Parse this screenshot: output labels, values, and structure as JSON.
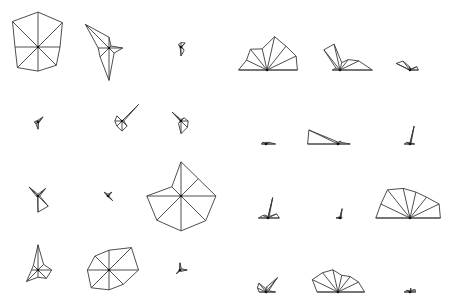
{
  "chart_data": {
    "type": "star",
    "title": "",
    "colors": {
      "stroke": "#3a3a3a",
      "hub": "#111111",
      "background": "#ffffff"
    },
    "panels": [
      {
        "name": "star-panel",
        "kind": "full",
        "variables": 8,
        "max_radius": 36,
        "glyphs": [
          {
            "cx": 38,
            "cy": 47,
            "r": [
              0.97,
              0.96,
              0.61,
              0.72,
              0.67,
              0.81,
              0.64,
              1.0
            ]
          },
          {
            "cx": 109,
            "cy": 48,
            "r": [
              0.3,
              0.08,
              0.38,
              0.2,
              0.9,
              0.35,
              0.3,
              0.93
            ]
          },
          {
            "cx": 181,
            "cy": 47,
            "r": [
              0.12,
              0.16,
              0.02,
              0.12,
              0.25,
              0.03,
              0.03,
              0.1
            ]
          },
          {
            "cx": 38,
            "cy": 122,
            "r": [
              0.05,
              0.2,
              0.04,
              0.02,
              0.2,
              0.08,
              0.1,
              0.05
            ]
          },
          {
            "cx": 122,
            "cy": 121,
            "r": [
              0.0,
              0.65,
              0.05,
              0.2,
              0.28,
              0.2,
              0.2,
              0.2
            ]
          },
          {
            "cx": 181,
            "cy": 121,
            "r": [
              0.04,
              0.12,
              0.2,
              0.25,
              0.35,
              0.1,
              0.02,
              0.35
            ]
          },
          {
            "cx": 38,
            "cy": 196,
            "r": [
              0.05,
              0.3,
              0.05,
              0.4,
              0.45,
              0.02,
              0.05,
              0.35
            ]
          },
          {
            "cx": 108,
            "cy": 196,
            "r": [
              0.05,
              0.15,
              0.02,
              0.18,
              0.02,
              0.02,
              0.02,
              0.15
            ]
          },
          {
            "cx": 181,
            "cy": 196,
            "r": [
              0.95,
              0.68,
              0.97,
              0.97,
              0.97,
              0.95,
              0.95,
              0.36
            ]
          },
          {
            "cx": 38,
            "cy": 270,
            "r": [
              0.7,
              0.22,
              0.38,
              0.33,
              0.2,
              0.45,
              0.18,
              0.18
            ]
          },
          {
            "cx": 109,
            "cy": 270,
            "r": [
              0.55,
              0.88,
              0.82,
              0.56,
              0.55,
              0.7,
              0.6,
              0.55
            ]
          },
          {
            "cx": 180,
            "cy": 270,
            "r": [
              0.2,
              0.05,
              0.2,
              0.05,
              0.03,
              0.15,
              0.02,
              0.02
            ]
          }
        ]
      },
      {
        "name": "segment-panel",
        "kind": "half",
        "variables": 8,
        "max_radius": 38,
        "glyphs": [
          {
            "cx": 267,
            "cy": 70,
            "r": [
              0.75,
              0.6,
              0.7,
              0.57,
              0.9,
              0.8,
              0.85,
              0.8
            ]
          },
          {
            "cx": 340,
            "cy": 70,
            "r": [
              0.2,
              0.12,
              0.68,
              0.7,
              0.2,
              0.35,
              0.55,
              0.85
            ]
          },
          {
            "cx": 410,
            "cy": 70,
            "r": [
              0.02,
              0.4,
              0.3,
              0.1,
              0.05,
              0.03,
              0.2,
              0.22
            ]
          },
          {
            "cx": 266,
            "cy": 144,
            "r": [
              0.12,
              0.1,
              0.05,
              0.02,
              0.05,
              0.05,
              0.1,
              0.25
            ]
          },
          {
            "cx": 338,
            "cy": 144,
            "r": [
              0.8,
              0.85,
              0.1,
              0.05,
              0.05,
              0.1,
              0.1,
              0.32
            ]
          },
          {
            "cx": 410,
            "cy": 144,
            "r": [
              0.15,
              0.1,
              0.05,
              0.02,
              0.48,
              0.05,
              0.05,
              0.12
            ]
          },
          {
            "cx": 268,
            "cy": 218,
            "r": [
              0.25,
              0.15,
              0.1,
              0.02,
              0.55,
              0.05,
              0.25,
              0.3
            ]
          },
          {
            "cx": 340,
            "cy": 218,
            "r": [
              0.1,
              0.05,
              0.02,
              0.02,
              0.25,
              0.05,
              0.05,
              0.05
            ]
          },
          {
            "cx": 410,
            "cy": 218,
            "r": [
              0.9,
              0.85,
              0.95,
              0.8,
              0.7,
              0.7,
              0.85,
              0.8
            ]
          },
          {
            "cx": 266,
            "cy": 292,
            "r": [
              0.18,
              0.25,
              0.3,
              0.1,
              0.15,
              0.48,
              0.08,
              0.25
            ]
          },
          {
            "cx": 338,
            "cy": 292,
            "r": [
              0.55,
              0.75,
              0.65,
              0.6,
              0.45,
              0.52,
              0.6,
              0.7
            ]
          },
          {
            "cx": 410,
            "cy": 292,
            "r": [
              0.15,
              0.1,
              0.05,
              0.02,
              0.1,
              0.05,
              0.15,
              0.15
            ]
          }
        ]
      }
    ]
  }
}
